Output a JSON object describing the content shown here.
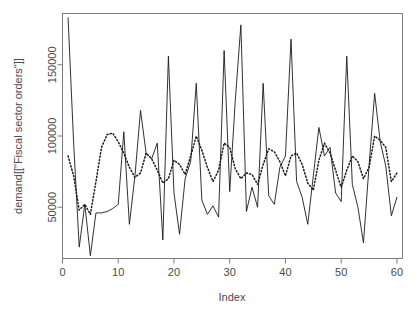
{
  "chart_data": {
    "type": "line",
    "title": "",
    "xlabel": "Index",
    "ylabel": "demand[[\"Fiscal sector orders\"]]",
    "xlim": [
      0,
      61
    ],
    "ylim": [
      14000,
      186000
    ],
    "xticks": [
      0,
      10,
      20,
      30,
      40,
      50,
      60
    ],
    "xtick_labels": [
      "0",
      "10",
      "20",
      "30",
      "40",
      "50",
      "60"
    ],
    "yticks": [
      50000,
      100000,
      150000
    ],
    "ytick_labels": [
      "50000",
      "100000",
      "150000"
    ],
    "grid": false,
    "legend": "none",
    "box": true,
    "x": [
      1,
      2,
      3,
      4,
      5,
      6,
      7,
      8,
      9,
      10,
      11,
      12,
      13,
      14,
      15,
      16,
      17,
      18,
      19,
      20,
      21,
      22,
      23,
      24,
      25,
      26,
      27,
      28,
      29,
      30,
      31,
      32,
      33,
      34,
      35,
      36,
      37,
      38,
      39,
      40,
      41,
      42,
      43,
      44,
      45,
      46,
      47,
      48,
      49,
      50,
      51,
      52,
      53,
      54,
      55,
      56,
      57,
      58,
      59,
      60
    ],
    "series": [
      {
        "name": "observed",
        "style": "solid",
        "color": "#1a1a1a",
        "values": [
          183000,
          95000,
          22000,
          52000,
          16000,
          46000,
          46000,
          47000,
          49000,
          52000,
          103000,
          38000,
          72000,
          118000,
          88000,
          84000,
          95000,
          27000,
          156000,
          60000,
          31000,
          70000,
          82000,
          137000,
          55000,
          45000,
          51000,
          43000,
          160000,
          61000,
          125000,
          178000,
          47000,
          64000,
          50000,
          137000,
          58000,
          52000,
          78000,
          86000,
          168000,
          68000,
          57000,
          38000,
          72000,
          106000,
          86000,
          92000,
          60000,
          54000,
          156000,
          66000,
          50000,
          25000,
          79000,
          130000,
          96000,
          79000,
          44000,
          57000
        ]
      },
      {
        "name": "fitted",
        "style": "dotted",
        "color": "#1a1a1a",
        "values": [
          86000,
          72000,
          48000,
          52000,
          45000,
          68000,
          92000,
          101000,
          102000,
          96000,
          88000,
          78000,
          71000,
          74000,
          88000,
          84000,
          76000,
          67000,
          70000,
          83000,
          80000,
          73000,
          86000,
          100000,
          90000,
          78000,
          68000,
          76000,
          95000,
          92000,
          77000,
          70000,
          74000,
          73000,
          66000,
          80000,
          91000,
          89000,
          82000,
          72000,
          86000,
          88000,
          80000,
          67000,
          62000,
          83000,
          95000,
          88000,
          76000,
          64000,
          76000,
          86000,
          82000,
          70000,
          78000,
          100000,
          97000,
          92000,
          68000,
          74000
        ]
      }
    ]
  },
  "axes": {
    "x_title": "Index",
    "y_title": "demand[[\"Fiscal sector orders\"]]"
  }
}
